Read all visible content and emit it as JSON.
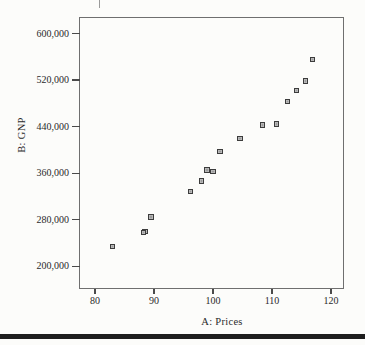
{
  "figure": {
    "background": "#fcfcfa",
    "frame_color": "#6f6f6f",
    "tick_color": "#4a4a4a",
    "text_color": "#2a2a2a",
    "marker_fill": "#9a9a9a",
    "marker_border": "#3c3c3c",
    "bottom_rule_color": "#1e1e1e"
  },
  "chart_data": {
    "type": "scatter",
    "title": "",
    "xlabel": "A: Prices",
    "ylabel": "B: GNP",
    "xlim": [
      80,
      120
    ],
    "ylim": [
      200000,
      600000
    ],
    "grid": false,
    "legend": "none",
    "marker_shape": "square",
    "x_ticks": [
      {
        "value": 80,
        "label": "80"
      },
      {
        "value": 90,
        "label": "90"
      },
      {
        "value": 100,
        "label": "100"
      },
      {
        "value": 110,
        "label": "110"
      },
      {
        "value": 120,
        "label": "120"
      }
    ],
    "y_ticks": [
      {
        "value": 200000,
        "label": "200,000"
      },
      {
        "value": 280000,
        "label": "280,000"
      },
      {
        "value": 360000,
        "label": "360,000"
      },
      {
        "value": 440000,
        "label": "440,000"
      },
      {
        "value": 520000,
        "label": "520,000"
      },
      {
        "value": 600000,
        "label": "600,000"
      }
    ],
    "points": [
      {
        "x": 83.0,
        "y": 234289
      },
      {
        "x": 88.5,
        "y": 259426
      },
      {
        "x": 88.2,
        "y": 258054
      },
      {
        "x": 89.5,
        "y": 284599
      },
      {
        "x": 96.2,
        "y": 328975
      },
      {
        "x": 98.1,
        "y": 346999
      },
      {
        "x": 99.0,
        "y": 365385
      },
      {
        "x": 100.0,
        "y": 363112
      },
      {
        "x": 101.2,
        "y": 397469
      },
      {
        "x": 104.6,
        "y": 419180
      },
      {
        "x": 108.4,
        "y": 442769
      },
      {
        "x": 110.8,
        "y": 444546
      },
      {
        "x": 112.6,
        "y": 482704
      },
      {
        "x": 114.2,
        "y": 502601
      },
      {
        "x": 115.7,
        "y": 518173
      },
      {
        "x": 116.9,
        "y": 554894
      }
    ]
  }
}
